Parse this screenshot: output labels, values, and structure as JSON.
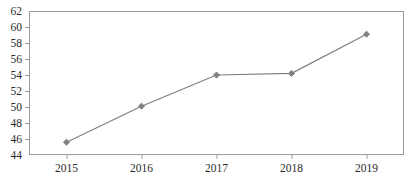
{
  "chart_data": {
    "type": "line",
    "title": "",
    "subtitle": "",
    "xlabel": "",
    "ylabel": "",
    "categories": [
      "2015",
      "2016",
      "2017",
      "2018",
      "2019"
    ],
    "x": [
      2015,
      2016,
      2017,
      2018,
      2019
    ],
    "values": [
      45.6,
      50.1,
      54.0,
      54.2,
      59.1
    ],
    "series": [
      {
        "name": "",
        "values": [
          45.6,
          50.1,
          54.0,
          54.2,
          59.1
        ],
        "color": "#808080",
        "marker": "diamond",
        "line_width": 1.2
      }
    ],
    "ylim": [
      44,
      62
    ],
    "y_ticks": [
      44,
      46,
      48,
      50,
      52,
      54,
      56,
      58,
      60,
      62
    ],
    "y_tick_labels": [
      "44",
      "46",
      "48",
      "50",
      "52",
      "54",
      "56",
      "58",
      "60",
      "62"
    ],
    "x_ticks": [
      2015,
      2016,
      2017,
      2018,
      2019
    ],
    "x_tick_labels": [
      "2015",
      "2016",
      "2017",
      "2018",
      "2019"
    ],
    "grid": false,
    "legend": false,
    "legend_position": "none",
    "annotations": []
  },
  "style": {
    "plot_background": "#ffffff",
    "page_background": "#ffffff",
    "axis_color": "#9a9a9a",
    "tick_color": "#9a9a9a",
    "label_color": "#2b2b2b",
    "series_color": "#808080"
  },
  "plot_geometry": {
    "left": 29,
    "right": 404,
    "top": 11,
    "bottom": 155,
    "tick_length": 4,
    "marker_size": 3.1
  }
}
